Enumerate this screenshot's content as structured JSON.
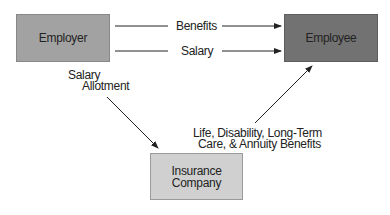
{
  "diagram": {
    "nodes": {
      "employer": {
        "label": "Employer",
        "fill": "#a2a2a2"
      },
      "employee": {
        "label": "Employee",
        "fill": "#727272"
      },
      "insurance": {
        "label_line1": "Insurance",
        "label_line2": "Company",
        "fill": "#d0d0d0"
      }
    },
    "edges": {
      "benefits": {
        "label": "Benefits",
        "from": "Employer",
        "to": "Employee"
      },
      "salary": {
        "label": "Salary",
        "from": "Employer",
        "to": "Employee"
      },
      "allotment": {
        "label_line1": "Salary",
        "label_line2": "Allotment",
        "from": "Employer",
        "to": "Insurance Company"
      },
      "insurance_benefits": {
        "label_line1": "Life, Disability, Long-Term",
        "label_line2": "Care, & Annuity Benefits",
        "from": "Insurance Company",
        "to": "Employee"
      }
    }
  }
}
